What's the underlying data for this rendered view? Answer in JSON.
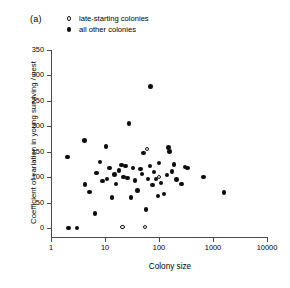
{
  "figure": {
    "panel_label": "(a)"
  },
  "legend": {
    "position": "top-left",
    "entries": [
      {
        "marker": "open-circle",
        "label": "late-starting colonies"
      },
      {
        "marker": "filled-circle",
        "label": "all other colonies"
      }
    ]
  },
  "axes": {
    "x": {
      "label": "Colony size",
      "scale": "log",
      "ticks": [
        1,
        10,
        100,
        1000,
        10000
      ],
      "tick_labels": [
        "1",
        "10",
        "100",
        "1000",
        "10000"
      ],
      "min": 1,
      "max": 10000
    },
    "y": {
      "label": "Coefficient of variation in young surviving / nest",
      "scale": "linear",
      "ticks": [
        0,
        50,
        100,
        150,
        200,
        250,
        300,
        350
      ],
      "tick_labels": [
        "0",
        "50",
        "100",
        "150",
        "200",
        "250",
        "300",
        "350"
      ],
      "min": 0,
      "max": 350
    }
  },
  "colors": {
    "filled_marker": "#0d0d0d",
    "open_marker_edge": "#141414",
    "open_marker_fill": "#ffffff",
    "axis": "#4a4a4a",
    "background": "#ffffff"
  },
  "chart_data": {
    "type": "scatter",
    "title": "(a)",
    "xlabel": "Colony size",
    "ylabel": "Coefficient of variation in young surviving / nest",
    "xscale": "log",
    "xlim": [
      1,
      10000
    ],
    "ylim": [
      0,
      350
    ],
    "grid": false,
    "legend_position": "top-left",
    "series": [
      {
        "name": "all other colonies",
        "marker": "filled-circle",
        "points": [
          {
            "x": 2.0,
            "y": 140
          },
          {
            "x": 2.1,
            "y": 0
          },
          {
            "x": 3.0,
            "y": 0
          },
          {
            "x": 4.2,
            "y": 172
          },
          {
            "x": 4.3,
            "y": 86
          },
          {
            "x": 5.2,
            "y": 71
          },
          {
            "x": 6.5,
            "y": 29
          },
          {
            "x": 7.0,
            "y": 108
          },
          {
            "x": 8.0,
            "y": 130
          },
          {
            "x": 9.0,
            "y": 92
          },
          {
            "x": 10.5,
            "y": 160
          },
          {
            "x": 11.0,
            "y": 96
          },
          {
            "x": 12.0,
            "y": 118
          },
          {
            "x": 13.5,
            "y": 60
          },
          {
            "x": 15.0,
            "y": 105
          },
          {
            "x": 16.0,
            "y": 87
          },
          {
            "x": 18.0,
            "y": 113
          },
          {
            "x": 20.0,
            "y": 124
          },
          {
            "x": 22.0,
            "y": 100
          },
          {
            "x": 24.0,
            "y": 122
          },
          {
            "x": 26.0,
            "y": 98
          },
          {
            "x": 28.0,
            "y": 205
          },
          {
            "x": 30.0,
            "y": 60
          },
          {
            "x": 33.0,
            "y": 118
          },
          {
            "x": 36.0,
            "y": 93
          },
          {
            "x": 40.0,
            "y": 74
          },
          {
            "x": 45.0,
            "y": 116
          },
          {
            "x": 48.0,
            "y": 106
          },
          {
            "x": 52.0,
            "y": 147
          },
          {
            "x": 58.0,
            "y": 36
          },
          {
            "x": 62.0,
            "y": 96
          },
          {
            "x": 68.0,
            "y": 122
          },
          {
            "x": 70.0,
            "y": 278
          },
          {
            "x": 75.0,
            "y": 85
          },
          {
            "x": 80.0,
            "y": 110
          },
          {
            "x": 88.0,
            "y": 96
          },
          {
            "x": 95.0,
            "y": 63
          },
          {
            "x": 100.0,
            "y": 128
          },
          {
            "x": 110.0,
            "y": 88
          },
          {
            "x": 125.0,
            "y": 67
          },
          {
            "x": 140.0,
            "y": 104
          },
          {
            "x": 150.0,
            "y": 158
          },
          {
            "x": 155.0,
            "y": 150
          },
          {
            "x": 175.0,
            "y": 111
          },
          {
            "x": 190.0,
            "y": 125
          },
          {
            "x": 210.0,
            "y": 95
          },
          {
            "x": 260.0,
            "y": 87
          },
          {
            "x": 300.0,
            "y": 120
          },
          {
            "x": 340.0,
            "y": 118
          },
          {
            "x": 670.0,
            "y": 100
          },
          {
            "x": 1600.0,
            "y": 70
          }
        ]
      },
      {
        "name": "late-starting colonies",
        "marker": "open-circle",
        "points": [
          {
            "x": 21.0,
            "y": 2
          },
          {
            "x": 55.0,
            "y": 2
          },
          {
            "x": 60.0,
            "y": 155
          },
          {
            "x": 100.0,
            "y": 100
          }
        ]
      }
    ]
  }
}
